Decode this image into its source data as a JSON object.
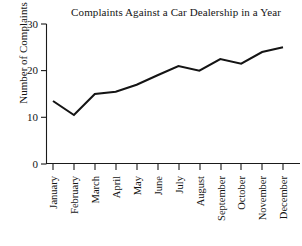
{
  "chart_data": {
    "type": "line",
    "title": "Complaints Against a Car Dealership in a Year",
    "xlabel": "",
    "ylabel": "Number of Complaints",
    "categories": [
      "January",
      "February",
      "March",
      "April",
      "May",
      "June",
      "July",
      "August",
      "September",
      "October",
      "November",
      "December"
    ],
    "values": [
      13.5,
      10.5,
      15,
      15.5,
      17,
      19,
      21,
      20,
      22.5,
      21.5,
      24,
      25
    ],
    "series": [
      {
        "name": "Complaints",
        "values": [
          13.5,
          10.5,
          15,
          15.5,
          17,
          19,
          21,
          20,
          22.5,
          21.5,
          24,
          25
        ]
      }
    ],
    "ylim": [
      0,
      30
    ],
    "yticks": [
      0,
      10,
      20,
      30
    ],
    "ytick_labels": [
      "0",
      "10",
      "20",
      "30"
    ],
    "grid": false,
    "legend": false,
    "line_color": "#141414"
  },
  "axes": {
    "y_title": "Number of Complaints",
    "tick_0": "0",
    "tick_10": "10",
    "tick_20": "20",
    "tick_30": "30"
  },
  "months": {
    "m1": "January",
    "m2": "February",
    "m3": "March",
    "m4": "April",
    "m5": "May",
    "m6": "June",
    "m7": "July",
    "m8": "August",
    "m9": "September",
    "m10": "October",
    "m11": "November",
    "m12": "December"
  }
}
